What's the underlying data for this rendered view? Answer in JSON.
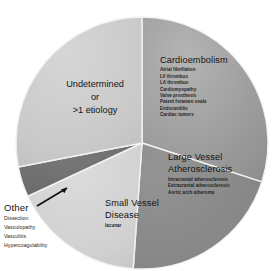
{
  "chart_data": {
    "type": "pie",
    "title": "",
    "subtitle": "",
    "legend_position": "in-slice",
    "grid": false,
    "categories": [
      "Cardioembolism",
      "Large Vessel Atherosclerosis",
      "Small Vessel Disease",
      "Other",
      "Undetermined or >1 etiology"
    ],
    "values": [
      30,
      21,
      17,
      4,
      28
    ],
    "unit": "percent",
    "start_angle_deg": 0,
    "direction": "clockwise",
    "slices": [
      {
        "label": "Cardioembolism",
        "value": 30,
        "color": "#9b9b9b",
        "start_deg": 0,
        "end_deg": 108
      },
      {
        "label": "Large Vessel Atherosclerosis",
        "value": 21,
        "color": "#898989",
        "start_deg": 108,
        "end_deg": 184
      },
      {
        "label": "Small Vessel Disease",
        "value": 17,
        "color": "#d2d2d2",
        "start_deg": 184,
        "end_deg": 245
      },
      {
        "label": "Other",
        "value": 4,
        "color": "#6e6e6e",
        "start_deg": 245,
        "end_deg": 259
      },
      {
        "label": "Undetermined or >1 etiology",
        "value": 28,
        "color": "#c9c9c9",
        "start_deg": 259,
        "end_deg": 360
      }
    ]
  },
  "labels": {
    "cardioembolism": {
      "title": "Cardioembolism",
      "items": [
        "Atrial fibrillation",
        "LV thrombus",
        "LA thrombus",
        "Cardiomyopathy",
        "Valve prosthesis",
        "Patent foramen ovale",
        "Endocarditis",
        "Cardiac tumors"
      ]
    },
    "large_vessel": {
      "title": "Large Vessel Atherosclerosis",
      "items": [
        "Intracranial atherosclerosis",
        "Extracranial atherosclerosis",
        "Aortic arch atheroma"
      ]
    },
    "small_vessel": {
      "title": "Small Vessel Disease",
      "items": [
        "lacunar"
      ]
    },
    "undetermined": {
      "line1": "Undetermined",
      "line2": "or",
      "line3": ">1 etiology"
    },
    "other": {
      "title": "Other",
      "items": [
        "Dissection",
        "Vasculopathy",
        "Vasculitis",
        "Hypercoagulability"
      ]
    }
  },
  "colors": {
    "background": "#ffffff",
    "slice_divider": "#f2f2f2",
    "text": "#141414",
    "leader_line": "#111111"
  }
}
